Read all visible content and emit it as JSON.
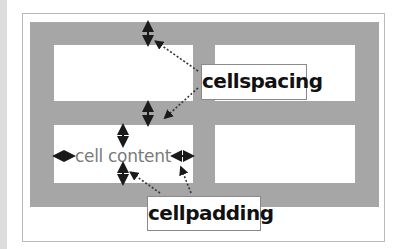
{
  "diagram": {
    "labels": {
      "cellspacing": "cellspacing",
      "cellpadding": "cellpadding",
      "cell_content": "cell content"
    },
    "table": {
      "rows": 2,
      "columns": 2,
      "cells": [
        {
          "row": 1,
          "col": 1,
          "content": ""
        },
        {
          "row": 1,
          "col": 2,
          "content": ""
        },
        {
          "row": 2,
          "col": 1,
          "content": "cell content"
        },
        {
          "row": 2,
          "col": 2,
          "content": ""
        }
      ]
    },
    "annotations": [
      {
        "label": "cellspacing",
        "points_to": [
          "spacing above top-left cell",
          "spacing between rows"
        ]
      },
      {
        "label": "cellpadding",
        "points_to": [
          "padding below cell content",
          "padding right of cell content"
        ]
      }
    ],
    "colors": {
      "table_background": "#a6a6a6",
      "cell_background": "#ffffff",
      "frame_border": "#b9b9b9",
      "content_text": "#7a7a7a",
      "label_text": "#111111",
      "arrow": "#1a1a1a"
    },
    "icons": {
      "spacing_arrows": "vertical-double-arrow-icon",
      "padding_arrows": "double-arrow-icon",
      "pointer_arrows": "dotted-pointer-arrow-icon"
    }
  }
}
